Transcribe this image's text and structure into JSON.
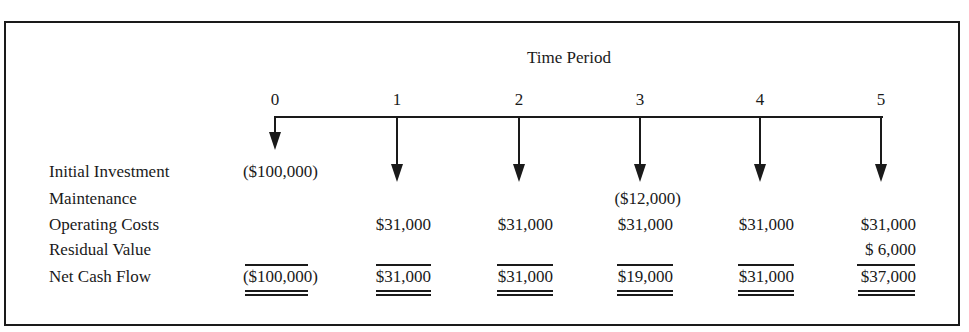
{
  "diagram": {
    "title": "Time Period",
    "periods": [
      "0",
      "1",
      "2",
      "3",
      "4",
      "5"
    ],
    "rows": [
      {
        "label": "Initial Investment",
        "values": [
          "($100,000)",
          "",
          "",
          "",
          "",
          ""
        ]
      },
      {
        "label": "Maintenance",
        "values": [
          "",
          "",
          "",
          "($12,000)",
          "",
          ""
        ]
      },
      {
        "label": "Operating Costs",
        "values": [
          "",
          "$31,000",
          "$31,000",
          "$31,000",
          "$31,000",
          "$31,000"
        ]
      },
      {
        "label": "Residual Value",
        "values": [
          "",
          "",
          "",
          "",
          "",
          "$ 6,000"
        ]
      },
      {
        "label": "Net Cash Flow",
        "values": [
          "($100,000)",
          "$31,000",
          "$31,000",
          "$19,000",
          "$31,000",
          "$37,000"
        ]
      }
    ]
  }
}
